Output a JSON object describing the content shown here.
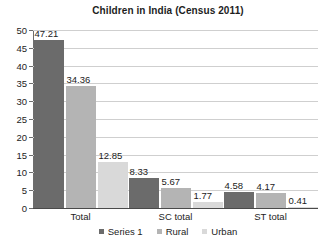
{
  "chart_data": {
    "type": "bar",
    "title": "Children in India (Census 2011)",
    "xlabel": "",
    "ylabel": "",
    "categories": [
      "Total",
      "SC total",
      "ST total"
    ],
    "series": [
      {
        "name": "Series 1",
        "color": "#6b6b6b",
        "values": [
          47.21,
          34.36,
          12.85
        ]
      },
      {
        "name": "Rural",
        "color": "#a9a9a9",
        "values": [
          8.33,
          5.67,
          1.77
        ]
      },
      {
        "name": "Urban",
        "color": "#d9d9d9",
        "values": [
          4.58,
          4.17,
          0.41
        ]
      }
    ],
    "groups": [
      {
        "category": "Total",
        "bars": [
          {
            "series": "Series 1",
            "value": 47.21,
            "label": "47.21",
            "color": "#6b6b6b"
          },
          {
            "series": "Rural",
            "value": 34.36,
            "label": "34.36",
            "color": "#b4b4b4"
          },
          {
            "series": "Urban",
            "value": 12.85,
            "label": "12.85",
            "color": "#d9d9d9"
          }
        ]
      },
      {
        "category": "SC total",
        "bars": [
          {
            "series": "Series 1",
            "value": 8.33,
            "label": "8.33",
            "color": "#6b6b6b"
          },
          {
            "series": "Rural",
            "value": 5.67,
            "label": "5.67",
            "color": "#b4b4b4"
          },
          {
            "series": "Urban",
            "value": 1.77,
            "label": "1.77",
            "color": "#d9d9d9"
          }
        ]
      },
      {
        "category": "ST total",
        "bars": [
          {
            "series": "Series 1",
            "value": 4.58,
            "label": "4.58",
            "color": "#6b6b6b"
          },
          {
            "series": "Rural",
            "value": 4.17,
            "label": "4.17",
            "color": "#b4b4b4"
          },
          {
            "series": "Urban",
            "value": 0.41,
            "label": "0.41",
            "color": "#d9d9d9"
          }
        ]
      }
    ],
    "ylim": [
      0,
      50
    ],
    "yticks": [
      0,
      5,
      10,
      15,
      20,
      25,
      30,
      35,
      40,
      45,
      50
    ],
    "ytick_labels": [
      "0",
      "5",
      "10",
      "15",
      "20",
      "25",
      "30",
      "35",
      "40",
      "45",
      "50"
    ],
    "grid": true,
    "grid_color": "#cfcfcf",
    "legend_position": "bottom",
    "legend": [
      {
        "label": "Series 1",
        "color": "#6b6b6b"
      },
      {
        "label": "Rural",
        "color": "#b4b4b4"
      },
      {
        "label": "Urban",
        "color": "#d9d9d9"
      }
    ],
    "background": "#ffffff",
    "axis_color": "#4a4a4a",
    "text_color": "#232323"
  }
}
